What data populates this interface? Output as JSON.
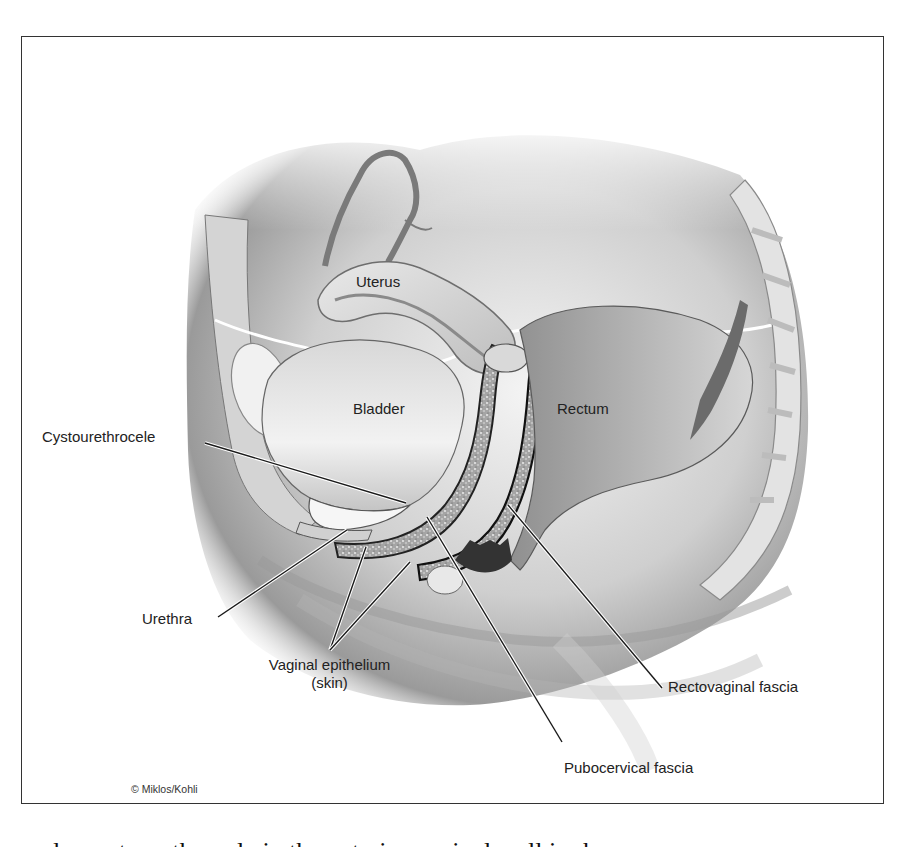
{
  "figure": {
    "frame": {
      "left": 21,
      "top": 36,
      "right": 884,
      "bottom": 804,
      "stroke": "#333333"
    },
    "copyright": "© Miklos/Kohli",
    "organ_labels": [
      {
        "id": "uterus",
        "text": "Uterus",
        "x": 356,
        "y": 273
      },
      {
        "id": "bladder",
        "text": "Bladder",
        "x": 353,
        "y": 400
      },
      {
        "id": "rectum",
        "text": "Rectum",
        "x": 557,
        "y": 400
      }
    ],
    "callouts": [
      {
        "id": "cystourethrocele",
        "text": "Cystourethrocele",
        "x": 42,
        "y": 428,
        "lines": [
          {
            "x1": 205,
            "y1": 443,
            "x2": 406,
            "y2": 503
          }
        ]
      },
      {
        "id": "urethra",
        "text": "Urethra",
        "x": 142,
        "y": 613,
        "lines": [
          {
            "x1": 218,
            "y1": 617,
            "x2": 347,
            "y2": 530
          }
        ]
      },
      {
        "id": "vaginal-epithelium",
        "text": "Vaginal epithelium",
        "text2": "(skin)",
        "x": 237,
        "y": 656,
        "lines": [
          {
            "x1": 330,
            "y1": 650,
            "x2": 366,
            "y2": 547
          },
          {
            "x1": 330,
            "y1": 650,
            "x2": 410,
            "y2": 562
          }
        ]
      },
      {
        "id": "rectovaginal-fascia",
        "text": "Rectovaginal fascia",
        "x": 668,
        "y": 680,
        "lines": [
          {
            "x1": 662,
            "y1": 688,
            "x2": 508,
            "y2": 505
          }
        ]
      },
      {
        "id": "pubocervical-fascia",
        "text": "Pubocervical fascia",
        "x": 564,
        "y": 759,
        "lines": [
          {
            "x1": 562,
            "y1": 742,
            "x2": 427,
            "y2": 517
          }
        ]
      }
    ],
    "colors": {
      "ink": "#222222",
      "line": "#1a1a1a",
      "line_halo": "#ffffff",
      "tissue_light": "#e6e6e6",
      "tissue_mid": "#b8b8b8",
      "tissue_dark": "#6f6f6f",
      "fascia_speckle": "#9a9a9a"
    }
  },
  "caption_fragment": "and a cystourethrocele in the anterior vaginal wall is shown"
}
